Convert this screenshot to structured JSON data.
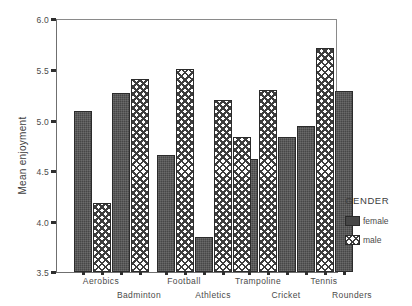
{
  "chart_data": {
    "type": "bar",
    "title": "",
    "xlabel": "",
    "ylabel": "Mean enjoyment",
    "ylim": [
      3.5,
      6.0
    ],
    "yticks": [
      "6.0",
      "5.5",
      "5.0",
      "4.5",
      "4.0",
      "3.5"
    ],
    "ytick_values": [
      6.0,
      5.5,
      5.0,
      4.5,
      4.0,
      3.5
    ],
    "grid": false,
    "categories": [
      "Aerobics",
      "Badminton",
      "Football",
      "Athletics",
      "Trampoline",
      "Cricket",
      "Tennis",
      "Rounders"
    ],
    "series": [
      {
        "name": "female",
        "values": [
          5.09,
          5.27,
          4.66,
          3.85,
          4.62,
          4.83,
          4.94,
          5.29
        ]
      },
      {
        "name": "male",
        "values": [
          4.18,
          5.41,
          5.51,
          5.2,
          5.3,
          4.83,
          5.71,
          5.29
        ]
      }
    ],
    "legend": {
      "title": "GENDER",
      "position": "right",
      "entries": [
        {
          "label": "female",
          "pattern": "solid-dark",
          "color": "#474747"
        },
        {
          "label": "male",
          "pattern": "crosshatch",
          "color": "#3d3d3d"
        }
      ]
    }
  },
  "bars": [
    {
      "category": "Aerobics",
      "series": "female",
      "value": 5.09,
      "x": 18
    },
    {
      "category": "Aerobics",
      "series": "male",
      "value": 4.18,
      "x": 37
    },
    {
      "category": "Badminton",
      "series": "female",
      "value": 5.27,
      "x": 56
    },
    {
      "category": "Badminton",
      "series": "male",
      "value": 5.41,
      "x": 75
    },
    {
      "category": "Football",
      "series": "female",
      "value": 4.66,
      "x": 101
    },
    {
      "category": "Football",
      "series": "male",
      "value": 5.51,
      "x": 120
    },
    {
      "category": "Athletics",
      "series": "female",
      "value": 3.85,
      "x": 139
    },
    {
      "category": "Athletics",
      "series": "male",
      "value": 5.2,
      "x": 158
    },
    {
      "category": "Trampoline",
      "series": "female",
      "value": 4.62,
      "x": 184
    },
    {
      "category": "Trampoline",
      "series": "male",
      "value": 5.3,
      "x": 203
    },
    {
      "category": "Cricket",
      "series": "female",
      "value": 4.83,
      "x": 222
    },
    {
      "category": "Cricket",
      "series": "male",
      "value": 4.83,
      "x": 177
    },
    {
      "category": "Tennis",
      "series": "female",
      "value": 4.94,
      "x": 241
    },
    {
      "category": "Tennis",
      "series": "male",
      "value": 5.71,
      "x": 260
    },
    {
      "category": "Rounders",
      "series": "female",
      "value": 5.29,
      "x": 279
    }
  ],
  "xaxis": {
    "row1": [
      {
        "label": "Aerobics",
        "x": 37
      },
      {
        "label": "Football",
        "x": 120
      },
      {
        "label": "Trampoline",
        "x": 194
      },
      {
        "label": "Tennis",
        "x": 260
      }
    ],
    "row2": [
      {
        "label": "Badminton",
        "x": 75
      },
      {
        "label": "Athletics",
        "x": 149
      },
      {
        "label": "Cricket",
        "x": 222
      },
      {
        "label": "Rounders",
        "x": 288
      }
    ],
    "ticks": [
      18,
      37,
      56,
      75,
      101,
      120,
      139,
      158,
      184,
      203,
      222,
      241,
      260,
      279
    ]
  }
}
